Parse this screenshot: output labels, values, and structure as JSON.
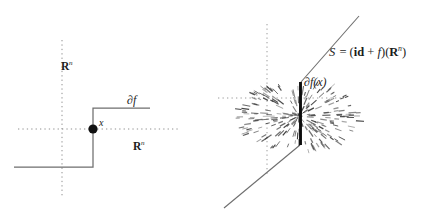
{
  "figure": {
    "background_color": "#ffffff",
    "width": 426,
    "height": 221,
    "panels": [
      {
        "id": "left",
        "name": "subdifferential-graph-panel",
        "description": "Step function graph with dotted coordinate axes and marked point x"
      },
      {
        "id": "right",
        "name": "surface-panel",
        "description": "Diagonal line S with vertical segment and radiating dash cloud at the kink"
      }
    ]
  },
  "left_panel": {
    "axis_vertical_label": "R",
    "axis_vertical_sup": "n",
    "axis_horizontal_label": "R",
    "axis_horizontal_sup": "n",
    "curve_label": "∂f",
    "point_label": "x",
    "axis_color": "#8a8a8a",
    "curve_color": "#6e6e6e",
    "point_color": "#111111"
  },
  "right_panel": {
    "surface_label_prefix": "S",
    "surface_label_equals": "=",
    "surface_label_open": "(",
    "surface_label_id": "id",
    "surface_label_plus": "+",
    "surface_label_f": "f",
    "surface_label_close_apply": ")(",
    "surface_label_R": "R",
    "surface_label_sup": "n",
    "surface_label_close": ")",
    "surface_label_full": "S = (id + f)(R^n)",
    "segment_label": "∂f(x)",
    "line_color": "#6e6e6e",
    "segment_color": "#0d0d0d",
    "cloud_color": "#3a3a3a",
    "axis_color": "#9a9a9a"
  },
  "chart_data": {
    "type": "line",
    "panels": [
      {
        "name": "left-step-graph",
        "xlabel": "R^n",
        "ylabel": "R^n",
        "grid": false,
        "axes_style": "dotted",
        "origin_px": [
          62,
          129
        ],
        "series": [
          {
            "name": "graph of ∂f",
            "type": "step",
            "points_px": [
              [
                14,
                167
              ],
              [
                93,
                167
              ],
              [
                93,
                108
              ],
              [
                150,
                108
              ]
            ]
          }
        ],
        "markers": [
          {
            "name": "point-x",
            "x_px": 93,
            "y_px": 129,
            "label": "x",
            "radius_px": 4.6
          }
        ],
        "annotations": [
          {
            "text": "∂f",
            "x_px": 127,
            "y_px": 94
          },
          {
            "text": "R^n",
            "x_px": 61,
            "y_px": 60
          },
          {
            "text": "R^n",
            "x_px": 133,
            "y_px": 140
          }
        ],
        "axis_extent_px": {
          "x": [
            18,
            178
          ],
          "y": [
            40,
            196
          ]
        }
      },
      {
        "name": "right-surface",
        "grid": false,
        "axes_style": "dotted",
        "origin_px": [
          267,
          98
        ],
        "series": [
          {
            "name": "S lower branch",
            "type": "line",
            "points_px": [
              [
                224,
                208
              ],
              [
                300,
                145
              ]
            ]
          },
          {
            "name": "∂f(x) vertical segment",
            "type": "line",
            "points_px": [
              [
                300,
                145
              ],
              [
                300,
                82
              ]
            ]
          },
          {
            "name": "S upper branch",
            "type": "line",
            "points_px": [
              [
                300,
                82
              ],
              [
                359,
                16
              ]
            ]
          }
        ],
        "cloud": {
          "name": "normal-cone-dash-cloud",
          "center_px": [
            299,
            116
          ],
          "radius_x_px": 62,
          "radius_y_px": 36,
          "dash_count": 240
        },
        "annotations": [
          {
            "text": "S = (id + f)(R^n)",
            "x_px": 329,
            "y_px": 45
          },
          {
            "text": "∂f(x)",
            "x_px": 304,
            "y_px": 76
          }
        ],
        "axis_extent_px": {
          "x": [
            218,
            344
          ],
          "y": [
            24,
            175
          ]
        }
      }
    ]
  }
}
